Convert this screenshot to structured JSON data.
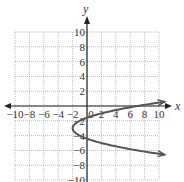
{
  "chart_data": {
    "type": "line",
    "title": "",
    "xlabel": "x",
    "ylabel": "y",
    "xlim": [
      -10,
      10
    ],
    "ylim": [
      -10,
      10
    ],
    "grid": true,
    "grid_step": 2,
    "x_ticks": [
      -10,
      -8,
      -6,
      -4,
      -2,
      0,
      2,
      4,
      6,
      8,
      10
    ],
    "x_tick_labels": [
      "−10",
      "−8",
      "−6",
      "−4",
      "−2",
      "0",
      "2",
      "4",
      "6",
      "8",
      "10"
    ],
    "y_ticks": [
      10,
      8,
      6,
      4,
      2,
      -2,
      -4,
      -6,
      -8,
      -10
    ],
    "y_tick_labels": [
      "10",
      "8",
      "6",
      "4",
      "2",
      "−2",
      "−4",
      "−6",
      "−8",
      "−10"
    ],
    "series": [
      {
        "name": "x = (y + 3)^2 − 2",
        "description": "Horizontal parabola opening right, vertex (-2, -3), arrows at both ends",
        "vertex": [
          -2,
          -3
        ],
        "y_intercepts": [
          -1.59,
          -4.41
        ],
        "points": [
          [
            10,
            0.46
          ],
          [
            7,
            0
          ],
          [
            2,
            -1
          ],
          [
            0,
            -1.59
          ],
          [
            -1,
            -2
          ],
          [
            -2,
            -3
          ],
          [
            -1,
            -4
          ],
          [
            0,
            -4.41
          ],
          [
            2,
            -5
          ],
          [
            7,
            -6
          ],
          [
            10,
            -6.46
          ]
        ],
        "color": "#555555"
      }
    ]
  },
  "axes": {
    "x_label": "x",
    "y_label": "y"
  }
}
